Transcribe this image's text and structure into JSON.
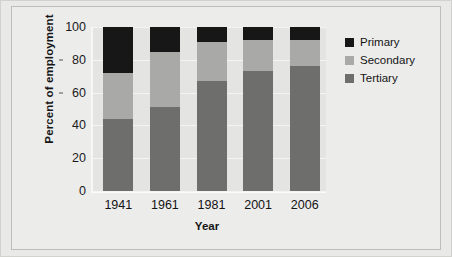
{
  "chart_data": {
    "type": "bar",
    "subtype": "stacked-100-percent",
    "title": "",
    "xlabel": "Year",
    "ylabel": "Percent of employment",
    "categories": [
      "1941",
      "1961",
      "1981",
      "2001",
      "2006"
    ],
    "ylim": [
      0,
      100
    ],
    "yticks": [
      0,
      20,
      40,
      60,
      80,
      100
    ],
    "ytick_labels": [
      "0",
      "20",
      "40",
      "60",
      "80",
      "100"
    ],
    "grid": true,
    "legend_position": "right",
    "series": [
      {
        "name": "Primary",
        "color": "#171717",
        "values": [
          28,
          15,
          9,
          8,
          8
        ]
      },
      {
        "name": "Secondary",
        "color": "#a9a9a7",
        "values": [
          28,
          34,
          24,
          19,
          16
        ]
      },
      {
        "name": "Tertiary",
        "color": "#6e6e6c",
        "values": [
          44,
          51,
          67,
          73,
          76
        ]
      }
    ],
    "stack_order_bottom_to_top": [
      "Tertiary",
      "Secondary",
      "Primary"
    ]
  },
  "legend": {
    "items": [
      {
        "label": "Primary",
        "color": "#171717"
      },
      {
        "label": "Secondary",
        "color": "#a9a9a7"
      },
      {
        "label": "Tertiary",
        "color": "#6e6e6c"
      }
    ]
  },
  "colors": {
    "figure_background": "#e9e9e7",
    "plot_background": "#e4e4e2",
    "gridline": "#f4f4f3",
    "text": "#161616"
  }
}
